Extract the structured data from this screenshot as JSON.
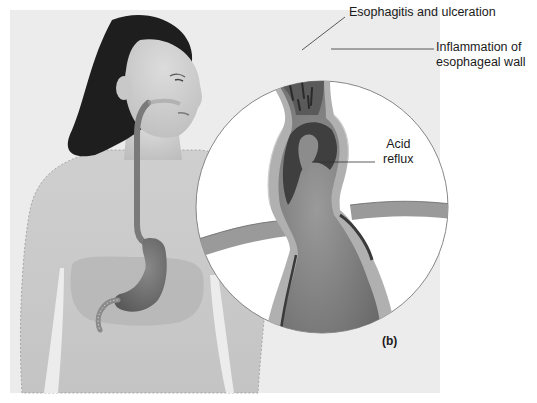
{
  "figure": {
    "panel_label": "(b)",
    "colors": {
      "background_panel": "#ececec",
      "skin": "#d4d4d4",
      "hair": "#1e1e1e",
      "tissue_dark": "#4a4a4a",
      "tissue_mid": "#7a7a7a",
      "tissue_light": "#a8a8a8",
      "circle_fill": "#ffffff",
      "leader_line": "#333333"
    }
  },
  "annotations": [
    {
      "id": "esophagitis",
      "text": "Esophagitis and ulceration"
    },
    {
      "id": "inflammation",
      "lines": [
        "Inflammation of",
        "esophageal wall"
      ]
    },
    {
      "id": "acid_reflux",
      "lines": [
        "Acid",
        "reflux"
      ]
    }
  ]
}
